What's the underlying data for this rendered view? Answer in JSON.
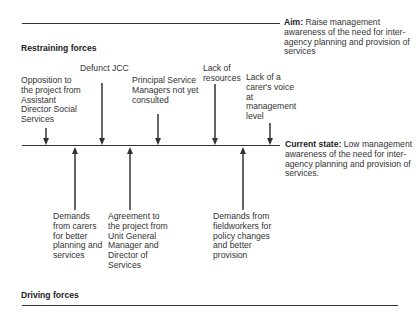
{
  "aim": {
    "label": "Aim:",
    "text": " Raise management awareness of the need for inter-agency planning and provision of services"
  },
  "current_state": {
    "label": "Current state:",
    "text": " Low management awareness of the need for inter-agency planning and provision of services."
  },
  "restraining": {
    "title": "Restraining forces",
    "forces": [
      {
        "label": "Opposition to the project from Assistant Director Social Services"
      },
      {
        "label": "Defunct JCC"
      },
      {
        "label": "Principal Service Managers not yet consulted"
      },
      {
        "label": "Lack of resources"
      },
      {
        "label": "Lack of a carer's voice at management level"
      }
    ]
  },
  "driving": {
    "title": "Driving forces",
    "forces": [
      {
        "label": "Demands from carers for better planning and services"
      },
      {
        "label": "Agreement to the project from Unit General Manager and Director of Services"
      },
      {
        "label": "Demands from fieldworkers for policy changes and better provision"
      }
    ]
  },
  "colors": {
    "line": "#333333",
    "text": "#333333",
    "background": "#ffffff"
  }
}
